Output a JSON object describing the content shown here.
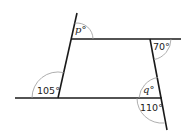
{
  "diagram": {
    "angles": [
      {
        "id": "p",
        "label": "p°",
        "location": "top-left exterior, between upper left line extension and top horizontal line"
      },
      {
        "id": "a70",
        "label": "70°",
        "location": "top-right, below top line right of right slanted line"
      },
      {
        "id": "a105",
        "label": "105°",
        "location": "bottom-left, above bottom line left of left slanted line"
      },
      {
        "id": "q",
        "label": "q°",
        "location": "bottom-right interior, above bottom line left of right slanted line"
      },
      {
        "id": "a110",
        "label": "110°",
        "location": "bottom-right exterior, below bottom line left of right slanted line"
      }
    ],
    "colors": {
      "line": "#1a1a1a",
      "arc": "#888888",
      "text": "#222222"
    }
  }
}
